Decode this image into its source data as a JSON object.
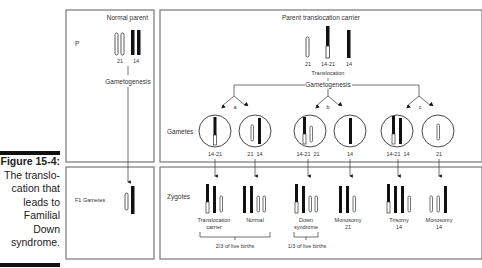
{
  "caption": {
    "title": "Figure 15-4:",
    "lines": [
      "The translo-",
      "cation that",
      "leads to",
      "Familial",
      "Down",
      "syndrome."
    ]
  },
  "panels": {
    "normal_parent": {
      "title": "Normal parent",
      "row_label": "P",
      "chromosomes": [
        "21",
        "14"
      ],
      "process": "Gametogenesis"
    },
    "carrier_parent": {
      "title": "Parent translocation carrier",
      "chromosomes": [
        "21",
        "14-21",
        "14"
      ],
      "event": "Translocation",
      "process": "Gametogenesis"
    },
    "f1": {
      "row_label": "F1 Gametes"
    },
    "gametes": {
      "row_label": "Gametes",
      "branches": [
        "a",
        "b",
        "c"
      ],
      "items": [
        {
          "label": "14-21"
        },
        {
          "label": "21  14"
        },
        {
          "label": "14-21  21"
        },
        {
          "label": "14"
        },
        {
          "label": "14-21  14"
        },
        {
          "label": "21"
        }
      ]
    },
    "zygotes": {
      "row_label": "Zygotes",
      "items": [
        {
          "line1": "Translocation",
          "line2": "carrier"
        },
        {
          "line1": "Normal",
          "line2": ""
        },
        {
          "line1": "Down",
          "line2": "syndrome"
        },
        {
          "line1": "Monosomy",
          "line2": "21"
        },
        {
          "line1": "Trisomy",
          "line2": "14"
        },
        {
          "line1": "Monosomy",
          "line2": "14"
        }
      ],
      "brackets": [
        {
          "label": "2/3 of live births"
        },
        {
          "label": "1/3 of live births"
        }
      ]
    }
  },
  "colors": {
    "frame": "#777777",
    "dark_chrom": "#111111",
    "light_chrom": "#ffffff"
  }
}
